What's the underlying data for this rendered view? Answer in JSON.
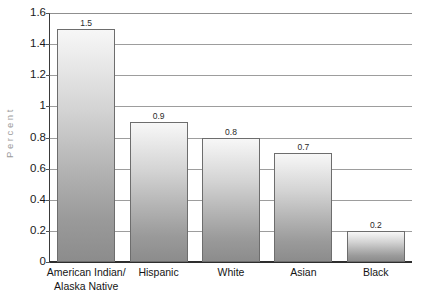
{
  "chart_data": {
    "type": "bar",
    "title": "",
    "subtitle": "",
    "xlabel": "",
    "ylabel": "Percent",
    "ylim": [
      0,
      1.6
    ],
    "grid": true,
    "legend": "none",
    "orientation": "vertical",
    "categories": [
      "American Indian/\nAlaska Native",
      "Hispanic",
      "White",
      "Asian",
      "Black"
    ],
    "category_lines": [
      [
        "American Indian/",
        "Alaska Native"
      ],
      [
        "Hispanic",
        ""
      ],
      [
        "White",
        ""
      ],
      [
        "Asian",
        ""
      ],
      [
        "Black",
        ""
      ]
    ],
    "values": [
      1.5,
      0.9,
      0.8,
      0.7,
      0.2
    ],
    "value_labels": [
      "1.5",
      "0.9",
      "0.8",
      "0.7",
      "0.2"
    ],
    "yticks": [
      0,
      0.2,
      0.4,
      0.6,
      0.8,
      1.0,
      1.2,
      1.4,
      1.6
    ],
    "ytick_labels": [
      "0",
      "0.2",
      "0.4",
      "0.6",
      "0.8",
      "1",
      "1.2",
      "1.4",
      "1.6"
    ],
    "colors": {
      "bar_gradient_top": "#f7f7f7",
      "bar_gradient_bottom": "#8c8c8c",
      "bar_border": "#6d6d6d",
      "gridline": "#9d9d9d",
      "axis": "#2e2e2e",
      "tick_text": "#1a1a1a",
      "ylabel_text": "#9a9a9a",
      "background": "#ffffff"
    }
  }
}
